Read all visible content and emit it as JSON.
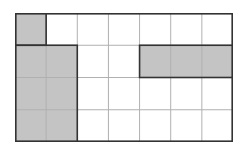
{
  "diagram": {
    "type": "grid-shading",
    "rows": 4,
    "cols": 7,
    "colors": {
      "shade": "#c4c4c4",
      "line": "#b0b0b0",
      "border": "#333333",
      "background": "#ffffff"
    },
    "shaded_regions": [
      {
        "row": 0,
        "col": 0,
        "rows": 1,
        "cols": 1
      },
      {
        "row": 1,
        "col": 0,
        "rows": 3,
        "cols": 2
      },
      {
        "row": 1,
        "col": 4,
        "rows": 1,
        "cols": 3
      }
    ]
  }
}
